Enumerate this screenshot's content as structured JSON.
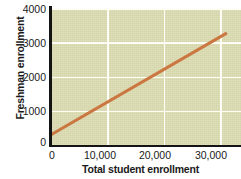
{
  "chart_data": {
    "type": "line",
    "title": "",
    "xlabel": "Total student enrollment",
    "ylabel": "Freshman enrollment",
    "xlim": [
      0,
      33700
    ],
    "ylim": [
      0,
      4000
    ],
    "grid": true,
    "legend": "none",
    "background_color": "#dcdcb2",
    "gridline_color": "#fdfdf5",
    "axis_color": "#141414",
    "line_color": "#cb7741",
    "xticks": [
      {
        "value": 0,
        "label": "0"
      },
      {
        "value": 10000,
        "label": "10,000"
      },
      {
        "value": 20000,
        "label": "20,000"
      },
      {
        "value": 30000,
        "label": "30,000"
      }
    ],
    "yticks": [
      {
        "value": 0,
        "label": "0"
      },
      {
        "value": 1000,
        "label": "1000"
      },
      {
        "value": 2000,
        "label": "2000"
      },
      {
        "value": 3000,
        "label": "3000"
      },
      {
        "value": 4000,
        "label": "4000"
      }
    ],
    "series": [
      {
        "name": "Freshman vs total enrollment trend",
        "x": [
          0,
          31000
        ],
        "values": [
          300,
          3250
        ]
      }
    ]
  }
}
